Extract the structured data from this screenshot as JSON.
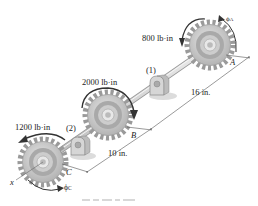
{
  "diagram": {
    "type": "shaft-with-gears",
    "colors": {
      "gear_face": "#c8c8c8",
      "gear_ring": "#a8a8a8",
      "gear_hub": "#e4e4e4",
      "shaft": "#d0d0d0",
      "shadow": "#dcdcdc",
      "arrow": "#333333",
      "dim_line": "#555555",
      "text": "#222222"
    },
    "torques": [
      {
        "id": "A",
        "label": "800 lb·in"
      },
      {
        "id": "B",
        "label": "2000 lb·in"
      },
      {
        "id": "C",
        "label": "1200 lb·in"
      }
    ],
    "bearings": [
      {
        "id": "1",
        "label": "(1)"
      },
      {
        "id": "2",
        "label": "(2)"
      }
    ],
    "points": {
      "A": "A",
      "B": "B",
      "C": "C",
      "axis": "x"
    },
    "angles": {
      "phi_A": "ϕ",
      "phi_A_sub": "A",
      "phi_C": "ϕ",
      "phi_C_sub": "C"
    },
    "dimensions": [
      {
        "id": "AB",
        "label": "16 in."
      },
      {
        "id": "BC",
        "label": "10 in."
      }
    ]
  }
}
